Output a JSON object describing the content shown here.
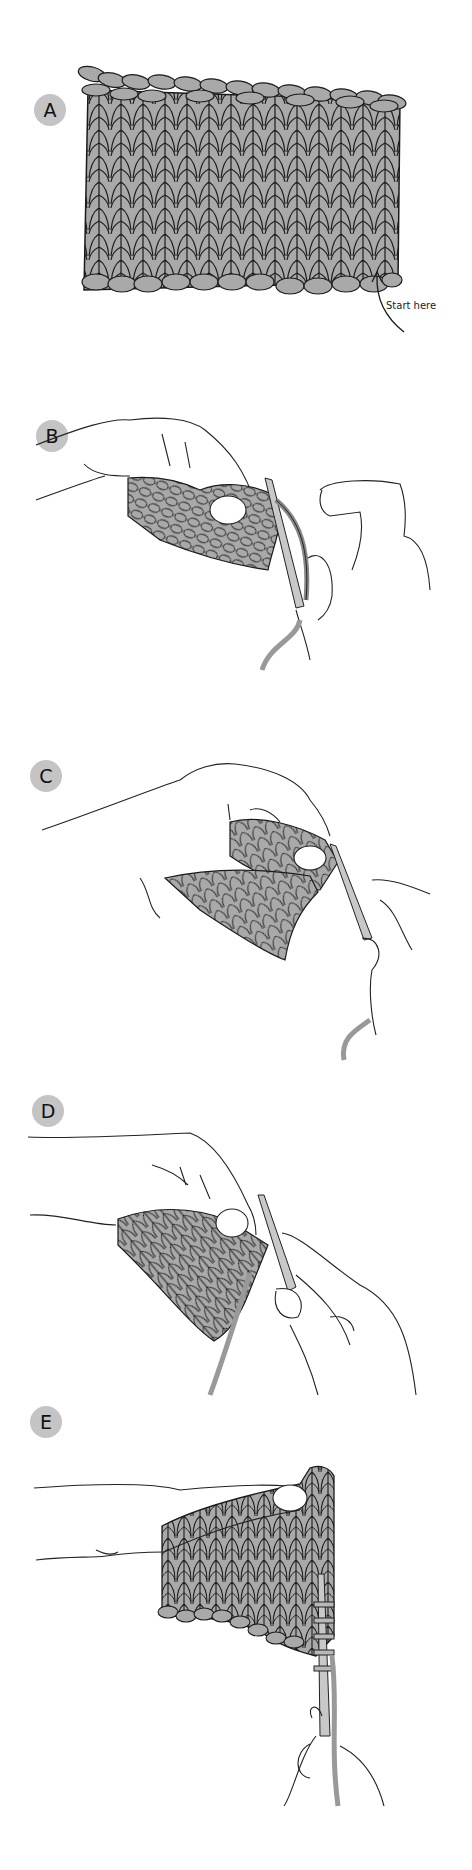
{
  "figure": {
    "steps": [
      {
        "label": "A",
        "description": "Knitted swatch with start point marked"
      },
      {
        "label": "B",
        "description": "Hands holding work with needle at right edge"
      },
      {
        "label": "C",
        "description": "Hands holding triangular worked section with needle"
      },
      {
        "label": "D",
        "description": "Hands holding work, yarn running down, needle inserted"
      },
      {
        "label": "E",
        "description": "Finished piece with stitches picked up along right edge onto needle"
      }
    ],
    "annotation": {
      "start_label": "Start here"
    }
  },
  "colors": {
    "fabric": "#a9a9a9",
    "outline": "#1a1a1a",
    "badge": "#c4c4c4",
    "needle": "#c8c8c8",
    "background": "#ffffff"
  }
}
